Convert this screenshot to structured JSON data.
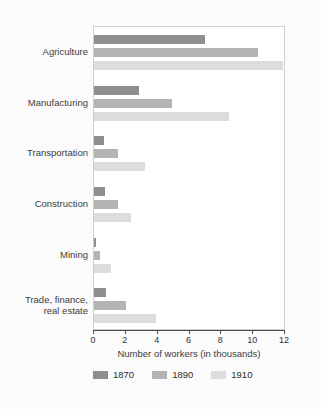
{
  "chart_data": {
    "type": "bar",
    "orientation": "horizontal",
    "title": "",
    "xlabel": "Number of workers (in thousands)",
    "ylabel": "",
    "xlim": [
      0,
      12
    ],
    "xticks": [
      0,
      2,
      4,
      6,
      8,
      10,
      12
    ],
    "xtick_labels": [
      "0",
      "2",
      "4",
      "6",
      "8",
      "10",
      "12"
    ],
    "grid": false,
    "legend_position": "bottom",
    "categories": [
      "Agriculture",
      "Manufacturing",
      "Transportation",
      "Construction",
      "Mining",
      "Trade, finance,\nreal estate"
    ],
    "series": [
      {
        "name": "1870",
        "color": "#8e8e8e",
        "values": [
          7.0,
          2.8,
          0.6,
          0.7,
          0.15,
          0.75
        ]
      },
      {
        "name": "1890",
        "color": "#b3b3b3",
        "values": [
          10.3,
          4.9,
          1.5,
          1.5,
          0.4,
          2.0
        ]
      },
      {
        "name": "1910",
        "color": "#dcdcdc",
        "values": [
          11.9,
          8.5,
          3.2,
          2.3,
          1.05,
          3.9
        ]
      }
    ]
  },
  "figure": {
    "background_color": "#fbfbfb",
    "plot_background_color": "#ffffff",
    "axis_color": "#4a4a4a",
    "text_color": "#3b3b3b"
  },
  "legend": {
    "items": [
      {
        "label": "1870",
        "color": "#8e8e8e"
      },
      {
        "label": "1890",
        "color": "#b3b3b3"
      },
      {
        "label": "1910",
        "color": "#dcdcdc"
      }
    ]
  }
}
